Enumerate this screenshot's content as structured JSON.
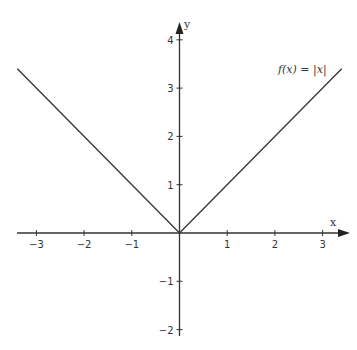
{
  "chart_data": {
    "type": "line",
    "title": "",
    "xlabel": "x",
    "ylabel": "y",
    "xlim": [
      -3.35,
      3.25
    ],
    "ylim": [
      -2.1,
      4.4
    ],
    "grid": false,
    "x_ticks": [
      -3,
      -2,
      -1,
      1,
      2,
      3
    ],
    "x_tick_labels": [
      "−3",
      "−2",
      "−1",
      "1",
      "2",
      "3"
    ],
    "y_ticks": [
      -2,
      -1,
      1,
      2,
      3,
      4
    ],
    "y_tick_labels": [
      "−2",
      "−1",
      "1",
      "2",
      "3",
      "4"
    ],
    "series": [
      {
        "name": "f(x) = |x|",
        "x": [
          -3.4,
          0,
          3.4
        ],
        "y": [
          3.4,
          0,
          3.4
        ]
      }
    ],
    "annotations": [
      {
        "text": "f(x) = |x|",
        "x": 2.2,
        "y": 3.0
      }
    ]
  }
}
